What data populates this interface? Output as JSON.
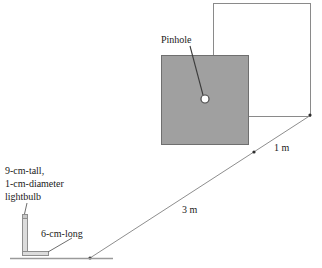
{
  "figure": {
    "labels": {
      "pinhole": "Pinhole",
      "distance_screen": "1 m",
      "distance_object": "3 m",
      "bulb_line1": "9-cm-tall,",
      "bulb_line2": "1-cm-diameter",
      "bulb_line3": "lightbulb",
      "base_length": "6-cm-long"
    },
    "colors": {
      "wall_fill": "#a0a0a0",
      "wall_stroke": "#6f6f6f",
      "screen_stroke": "#8a8a8a",
      "ray_stroke": "#8e8e8e",
      "leader_stroke": "#6e6e6e",
      "pinhole_fill": "#ffffff",
      "pinhole_stroke": "#4a4a4a",
      "text": "#1a1a1a",
      "background": "#ffffff",
      "ground_stroke": "#9a9a9a",
      "bulb_stroke": "#9a9a9a",
      "bulb_fill": "#d8d8d8"
    },
    "geometry": {
      "wall_square": {
        "x": 161,
        "y": 55,
        "width": 88,
        "height": 90
      },
      "screen_rect": {
        "x": 213,
        "y": 3,
        "width": 98,
        "height": 114
      },
      "pinhole": {
        "cx": 205,
        "cy": 99,
        "r": 4
      },
      "pinhole_leader": {
        "x1": 190,
        "y1": 46,
        "x2": 203,
        "y2": 96
      },
      "ray": {
        "x1": 90,
        "y1": 258,
        "x2": 311,
        "y2": 115
      },
      "ray_tick_mid": {
        "cx": 254,
        "cy": 152
      },
      "ray_tick_end": {
        "cx": 311,
        "cy": 115
      },
      "ray_tick_origin": {
        "cx": 90,
        "cy": 258
      },
      "ground_line": {
        "x1": 10,
        "y1": 258,
        "x2": 113,
        "y2": 258
      },
      "bulb_tube": {
        "x": 22,
        "y": 218,
        "width": 6,
        "height": 38
      },
      "bulb_cap": {
        "x": 22,
        "y": 215,
        "width": 6,
        "height": 4
      },
      "bulb_base": {
        "x": 22,
        "y": 252,
        "width": 26,
        "height": 5
      },
      "bulb_leader": {
        "x1": 26,
        "y1": 203,
        "x2": 24,
        "y2": 214
      },
      "base_leader": {
        "x1": 72,
        "y1": 237,
        "x2": 48,
        "y2": 252
      }
    },
    "text_positions": {
      "pinhole": {
        "x": 161,
        "y": 43
      },
      "distance_screen": {
        "x": 276,
        "y": 149
      },
      "distance_object": {
        "x": 183,
        "y": 212
      },
      "bulb_block": {
        "x": 5,
        "y": 173
      },
      "base_length": {
        "x": 41,
        "y": 236
      }
    }
  }
}
